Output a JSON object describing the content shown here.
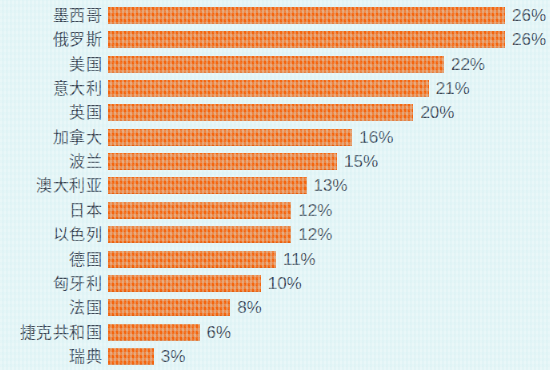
{
  "chart_data": {
    "type": "bar",
    "orientation": "horizontal",
    "title": "",
    "subtitle": "",
    "xlabel": "",
    "ylabel": "",
    "grid": false,
    "legend": null,
    "axis_visible": false,
    "value_suffix": "%",
    "xlim": [
      0,
      26
    ],
    "categories": [
      "墨西哥",
      "俄罗斯",
      "美国",
      "意大利",
      "英国",
      "加拿大",
      "波兰",
      "澳大利亚",
      "日本",
      "以色列",
      "德国",
      "匈牙利",
      "法国",
      "捷克共和国",
      "瑞典"
    ],
    "values": [
      26,
      26,
      22,
      21,
      20,
      16,
      15,
      13,
      12,
      12,
      11,
      10,
      8,
      6,
      3
    ],
    "value_labels": [
      "26%",
      "26%",
      "22%",
      "21%",
      "20%",
      "16%",
      "15%",
      "13%",
      "12%",
      "12%",
      "11%",
      "10%",
      "8%",
      "6%",
      "3%"
    ],
    "colors": {
      "bar": "#f4660f",
      "background": "#e9f7f8",
      "label_text": "#3c4654",
      "value_text": "#3c4654"
    }
  }
}
